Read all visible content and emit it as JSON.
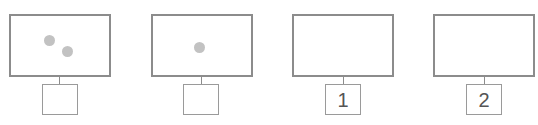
{
  "diagram": {
    "panels": [
      {
        "dots": 2,
        "label": ""
      },
      {
        "dots": 1,
        "label": ""
      },
      {
        "dots": 0,
        "label": "1"
      },
      {
        "dots": 0,
        "label": "2"
      }
    ]
  },
  "colors": {
    "frame": "#8c8c8c",
    "dot": "#c2c2c2",
    "text": "#555555"
  }
}
